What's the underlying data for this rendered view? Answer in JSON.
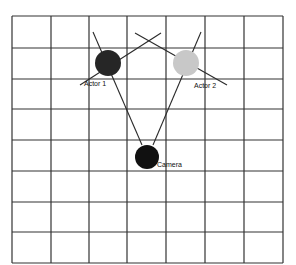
{
  "diagram": {
    "type": "camera-blocking-grid",
    "grid": {
      "x_lines": [
        12,
        51,
        89,
        127,
        166,
        205,
        244,
        283
      ],
      "y_lines": [
        16,
        48,
        79,
        109,
        140,
        171,
        202,
        232,
        263
      ],
      "columns": 7,
      "rows": 8,
      "line_color": "#333333"
    },
    "nodes": [
      {
        "id": "actor1",
        "label": "Actor 1",
        "cx": 108,
        "cy": 63,
        "r": 13,
        "fill": "#262626",
        "label_x": 84,
        "label_y": 86
      },
      {
        "id": "actor2",
        "label": "Actor 2",
        "cx": 186,
        "cy": 63,
        "r": 13,
        "fill": "#c8c8c8",
        "label_x": 194,
        "label_y": 88
      },
      {
        "id": "camera",
        "label": "Camera",
        "cx": 147,
        "cy": 157,
        "r": 12,
        "fill": "#111111",
        "label_x": 157,
        "label_y": 167
      }
    ],
    "lines": [
      {
        "id": "actor1-eyeline",
        "x1": 80,
        "y1": 85,
        "x2": 161,
        "y2": 33
      },
      {
        "id": "actor2-eyeline",
        "x1": 135,
        "y1": 33,
        "x2": 227,
        "y2": 85
      },
      {
        "id": "camera-to-actor1",
        "x1": 93,
        "y1": 32,
        "x2": 142,
        "y2": 145
      },
      {
        "id": "camera-to-actor2",
        "x1": 201,
        "y1": 32,
        "x2": 153,
        "y2": 145
      }
    ]
  }
}
